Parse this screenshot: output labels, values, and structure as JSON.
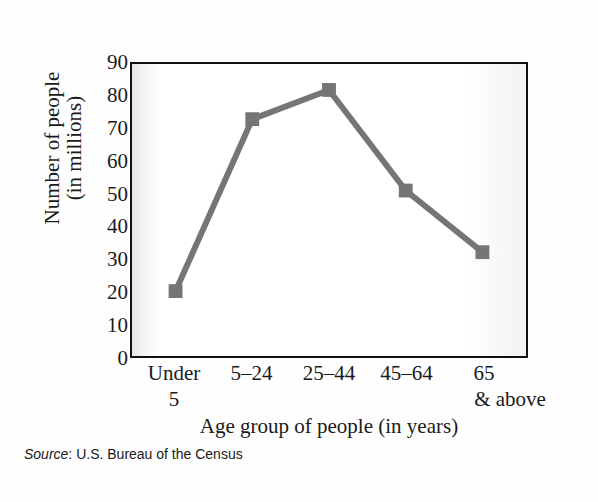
{
  "chart_data": {
    "type": "line",
    "title": "",
    "categories": [
      "Under 5",
      "5–24",
      "25–44",
      "45–64",
      "65 & above"
    ],
    "category_lines": [
      {
        "line1": "Under",
        "line2": "5",
        "shift_right": false
      },
      {
        "line1": "5–24",
        "line2": "",
        "shift_right": false
      },
      {
        "line1": "25–44",
        "line2": "",
        "shift_right": false
      },
      {
        "line1": "45–64",
        "line2": "",
        "shift_right": false
      },
      {
        "line1": "65",
        "line2": "& above",
        "shift_right": true
      }
    ],
    "values": [
      20,
      73,
      82,
      51,
      32
    ],
    "xlabel": "Age group of people (in years)",
    "ylabel_line1": "Number of people",
    "ylabel_line2": "(in millions)",
    "ylim": [
      0,
      90
    ],
    "ytick_values": [
      0,
      10,
      20,
      30,
      40,
      50,
      60,
      70,
      80,
      90
    ],
    "ytick_labels": [
      "0",
      "10",
      "20",
      "30",
      "40",
      "50",
      "60",
      "70",
      "80",
      "90"
    ],
    "grid": false,
    "legend": "none",
    "series_color": "#757575",
    "marker": "square",
    "marker_size": 14,
    "line_width": 6
  },
  "source": {
    "label": "Source",
    "separator": ": ",
    "text": "U.S. Bureau of the Census"
  },
  "colors": {
    "series": "#757575",
    "frame": "#111111",
    "text": "#1a1a1a",
    "plot_background": "#ffffff",
    "page_background": "#ffffff"
  }
}
